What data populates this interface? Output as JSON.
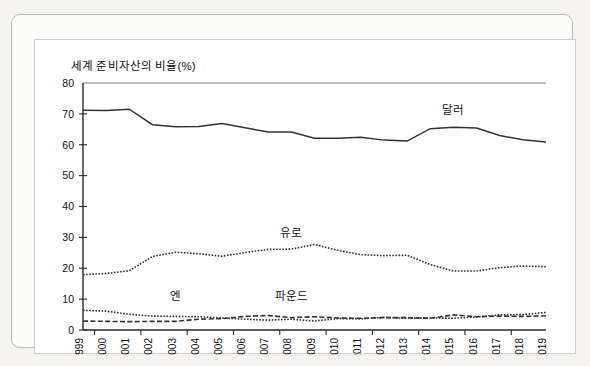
{
  "chart_data": {
    "type": "line",
    "title": "세계 준비자산의 비율(%)",
    "xlabel": "",
    "ylabel": "",
    "ylim": [
      0,
      80
    ],
    "ytick_values": [
      0,
      10,
      20,
      30,
      40,
      50,
      60,
      70,
      80
    ],
    "ytick_labels": [
      "0",
      "10",
      "20",
      "30",
      "40",
      "50",
      "60",
      "70",
      "80"
    ],
    "grid": false,
    "legend": "inline-annotations",
    "categories": [
      "1999",
      "2000",
      "2001",
      "2002",
      "2003",
      "2004",
      "2005",
      "2006",
      "2007",
      "2008",
      "2009",
      "2010",
      "2011",
      "2012",
      "2013",
      "2014",
      "2015",
      "2016",
      "2017",
      "2018",
      "2019"
    ],
    "series": [
      {
        "name": "달러",
        "style": "solid",
        "color": "#333333",
        "label_x_category": "2015",
        "label_value": 70.0,
        "values": [
          71.2,
          71.1,
          71.5,
          66.5,
          65.8,
          65.9,
          66.9,
          65.5,
          64.1,
          64.1,
          62.1,
          62.1,
          62.4,
          61.5,
          61.2,
          65.2,
          65.7,
          65.4,
          63.0,
          61.6,
          60.9
        ]
      },
      {
        "name": "유로",
        "style": "dotted",
        "color": "#333333",
        "label_x_category": "2008",
        "label_value": 30.0,
        "values": [
          17.9,
          18.3,
          19.2,
          23.8,
          25.2,
          24.7,
          23.9,
          25.1,
          26.1,
          26.2,
          27.7,
          25.8,
          24.4,
          24.1,
          24.2,
          21.2,
          19.1,
          19.1,
          20.2,
          20.7,
          20.5
        ]
      },
      {
        "name": "엔",
        "style": "dotted",
        "color": "#333333",
        "label_x_category": "2003",
        "label_value": 9.6,
        "values": [
          6.4,
          6.1,
          5.1,
          4.5,
          4.4,
          4.3,
          3.9,
          3.5,
          3.2,
          3.5,
          2.9,
          3.7,
          3.6,
          4.1,
          3.8,
          3.9,
          3.8,
          4.2,
          4.9,
          5.0,
          5.7
        ]
      },
      {
        "name": "파운드",
        "style": "dashed",
        "color": "#333333",
        "label_x_category": "2008",
        "label_value": 9.6,
        "values": [
          2.9,
          2.8,
          2.7,
          2.8,
          2.8,
          3.5,
          3.7,
          4.4,
          4.7,
          4.0,
          4.3,
          3.9,
          3.8,
          4.0,
          4.0,
          3.8,
          4.9,
          4.3,
          4.5,
          4.4,
          4.6
        ]
      }
    ]
  },
  "frame": {
    "outer_border_color": "#b9b9b6",
    "inner_border_color": "#cfcfcb",
    "page_background": "#f4f3f1",
    "plot_background": "#ffffff"
  }
}
